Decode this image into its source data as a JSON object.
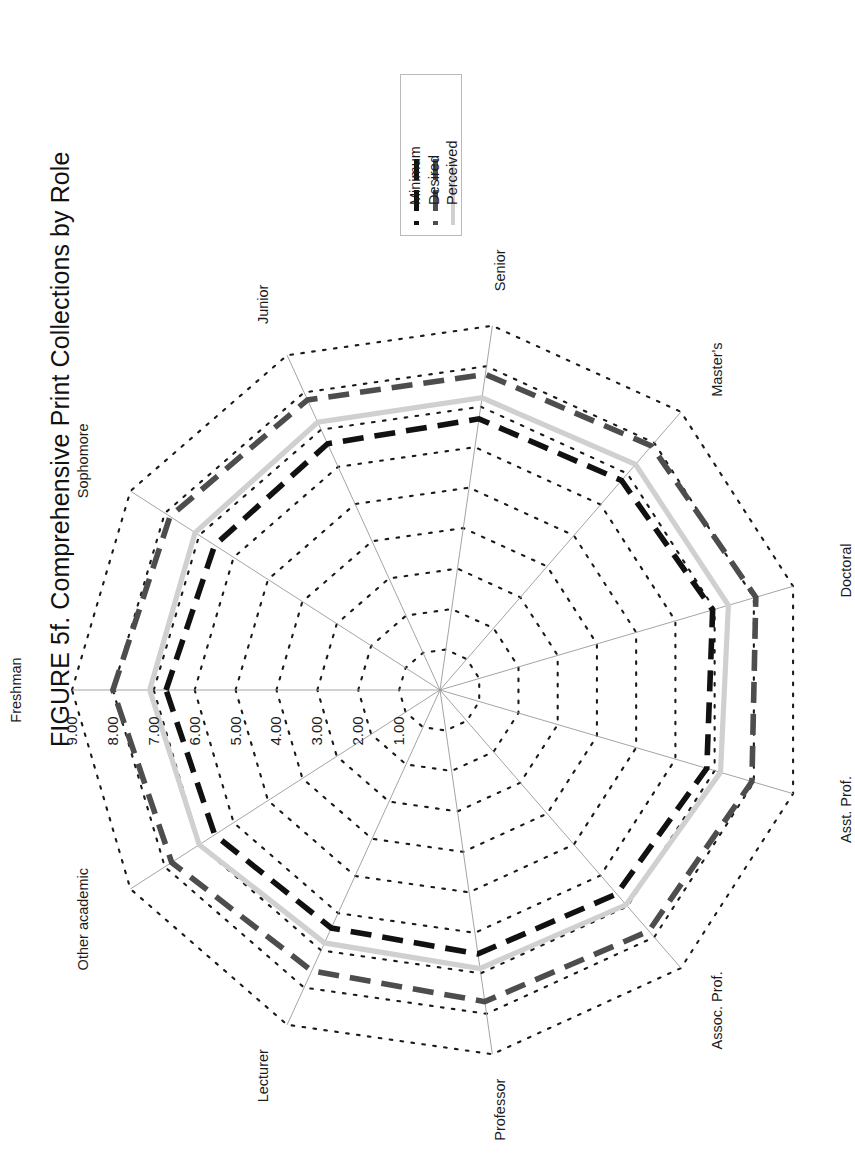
{
  "title": "FIGURE 5f. Comprehensive Print Collections by Role",
  "legend": {
    "items": [
      {
        "label": "Minimum",
        "color": "#111111",
        "style": "dashed"
      },
      {
        "label": "Desired",
        "color": "#4d4d4d",
        "style": "dashed"
      },
      {
        "label": "Perceived",
        "color": "#d0d0d0",
        "style": "solid"
      }
    ]
  },
  "chart_data": {
    "type": "radar",
    "title": "FIGURE 5f. Comprehensive Print Collections by Role",
    "categories": [
      "Freshman",
      "Sophomore",
      "Junior",
      "Senior",
      "Master's",
      "Doctoral",
      "Asst. Prof.",
      "Assoc. Prof.",
      "Professor",
      "Lecturer",
      "Other academic"
    ],
    "rlim": [
      0,
      9
    ],
    "rticks": [
      "1.00",
      "2.00",
      "3.00",
      "4.00",
      "5.00",
      "6.00",
      "7.00",
      "8.00",
      "9.00"
    ],
    "rtick_values": [
      1,
      2,
      3,
      4,
      5,
      6,
      7,
      8,
      9
    ],
    "grid": true,
    "legend_position": "top-right",
    "series": [
      {
        "name": "Minimum",
        "color": "#111111",
        "style": "dashed",
        "values": [
          6.7,
          6.55,
          6.62,
          6.7,
          6.78,
          6.95,
          6.8,
          6.6,
          6.52,
          6.4,
          6.55
        ]
      },
      {
        "name": "Desired",
        "color": "#4d4d4d",
        "style": "dashed",
        "values": [
          8.0,
          7.85,
          7.8,
          7.8,
          7.9,
          8.05,
          7.95,
          7.8,
          7.7,
          7.55,
          7.8
        ]
      },
      {
        "name": "Perceived",
        "color": "#d0d0d0",
        "style": "solid",
        "values": [
          7.1,
          7.12,
          7.2,
          7.22,
          7.3,
          7.35,
          7.15,
          6.95,
          6.88,
          6.8,
          7.0
        ]
      }
    ]
  },
  "axis_labels": [
    {
      "name": "Freshman",
      "text": "Freshman"
    },
    {
      "name": "Sophomore",
      "text": "Sophomore"
    },
    {
      "name": "Junior",
      "text": "Junior"
    },
    {
      "name": "Senior",
      "text": "Senior"
    },
    {
      "name": "Masters",
      "text": "Master's"
    },
    {
      "name": "Doctoral",
      "text": "Doctoral"
    },
    {
      "name": "AsstProf",
      "text": "Asst. Prof."
    },
    {
      "name": "AssocProf",
      "text": "Assoc. Prof."
    },
    {
      "name": "Professor",
      "text": "Professor"
    },
    {
      "name": "Lecturer",
      "text": "Lecturer"
    },
    {
      "name": "OtherAcademic",
      "text": "Other academic"
    }
  ],
  "tick_labels": [
    "1.00",
    "2.00",
    "3.00",
    "4.00",
    "5.00",
    "6.00",
    "7.00",
    "8.00",
    "9.00"
  ]
}
